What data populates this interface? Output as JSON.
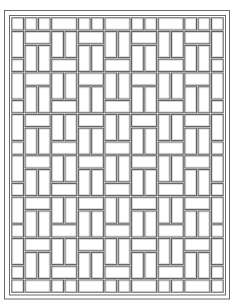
{
  "image": {
    "kind": "coloring-page",
    "subject": "basket-weave tile pattern",
    "width": 233,
    "height": 301,
    "line_color": "#5e5e5e",
    "background": "#ffffff"
  },
  "frame": {
    "outer": {
      "x": 4.5,
      "y": 10.5,
      "w": 225,
      "h": 288.5
    },
    "inner": {
      "x": 9.5,
      "y": 15.5,
      "w": 216,
      "h": 279.5
    }
  },
  "grid": {
    "x0": 11,
    "y0": 17,
    "cols": 16,
    "rows": 20,
    "cell_w": 13.31,
    "cell_h": 13.8,
    "gap": 1.6
  },
  "column_types": [
    "edge",
    "A",
    "A",
    "B",
    "B",
    "A",
    "A",
    "B",
    "B",
    "A",
    "A",
    "B",
    "B",
    "A",
    "A",
    "edge"
  ],
  "pattern_rules": {
    "edge": "square r0, then [vertical 2, square 1] repeating, final squares at r18 and r19",
    "A": "two squares at r0, then [horizontal 1, two verticals 2] repeating, horizontal at r19",
    "B": "horizontal at r0, then [two verticals 2, horizontal 1] repeating, two squares at r19"
  }
}
